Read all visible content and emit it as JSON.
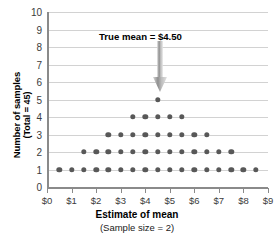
{
  "chart_data": {
    "type": "scatter",
    "title": "",
    "xlabel": "Estimate of mean",
    "xlabel_sub": "(Sample size = 2)",
    "ylabel": "Number of samples",
    "ylabel_sub": "(Total = 45)",
    "xlim": [
      0,
      9
    ],
    "ylim": [
      0,
      10
    ],
    "grid": true,
    "legend": "none",
    "x_tick_labels": [
      "$0",
      "$1",
      "$2",
      "$3",
      "$4",
      "$5",
      "$6",
      "$7",
      "$8",
      "$9"
    ],
    "x_tick_values": [
      0,
      1,
      2,
      3,
      4,
      5,
      6,
      7,
      8,
      9
    ],
    "y_tick_labels": [
      "0",
      "1",
      "2",
      "3",
      "4",
      "5",
      "6",
      "7",
      "8",
      "9",
      "10"
    ],
    "y_tick_values": [
      0,
      1,
      2,
      3,
      4,
      5,
      6,
      7,
      8,
      9,
      10
    ],
    "marker_color": "#585858",
    "gridline_color": "#d2d2d2",
    "axis_color": "#8a8a8a",
    "points": [
      {
        "x": 0.5,
        "y": 1
      },
      {
        "x": 1.0,
        "y": 1
      },
      {
        "x": 1.5,
        "y": 1
      },
      {
        "x": 2.0,
        "y": 1
      },
      {
        "x": 2.5,
        "y": 1
      },
      {
        "x": 3.0,
        "y": 1
      },
      {
        "x": 3.5,
        "y": 1
      },
      {
        "x": 4.0,
        "y": 1
      },
      {
        "x": 4.5,
        "y": 1
      },
      {
        "x": 5.0,
        "y": 1
      },
      {
        "x": 5.5,
        "y": 1
      },
      {
        "x": 6.0,
        "y": 1
      },
      {
        "x": 6.5,
        "y": 1
      },
      {
        "x": 7.0,
        "y": 1
      },
      {
        "x": 7.5,
        "y": 1
      },
      {
        "x": 8.0,
        "y": 1
      },
      {
        "x": 8.5,
        "y": 1
      },
      {
        "x": 1.5,
        "y": 2
      },
      {
        "x": 2.0,
        "y": 2
      },
      {
        "x": 2.5,
        "y": 2
      },
      {
        "x": 3.0,
        "y": 2
      },
      {
        "x": 3.5,
        "y": 2
      },
      {
        "x": 4.0,
        "y": 2
      },
      {
        "x": 4.5,
        "y": 2
      },
      {
        "x": 5.0,
        "y": 2
      },
      {
        "x": 5.5,
        "y": 2
      },
      {
        "x": 6.0,
        "y": 2
      },
      {
        "x": 6.5,
        "y": 2
      },
      {
        "x": 7.0,
        "y": 2
      },
      {
        "x": 7.5,
        "y": 2
      },
      {
        "x": 2.5,
        "y": 3
      },
      {
        "x": 3.0,
        "y": 3
      },
      {
        "x": 3.5,
        "y": 3
      },
      {
        "x": 4.0,
        "y": 3
      },
      {
        "x": 4.5,
        "y": 3
      },
      {
        "x": 5.0,
        "y": 3
      },
      {
        "x": 5.5,
        "y": 3
      },
      {
        "x": 6.0,
        "y": 3
      },
      {
        "x": 6.5,
        "y": 3
      },
      {
        "x": 3.5,
        "y": 4
      },
      {
        "x": 4.0,
        "y": 4
      },
      {
        "x": 4.5,
        "y": 4
      },
      {
        "x": 5.0,
        "y": 4
      },
      {
        "x": 5.5,
        "y": 4
      },
      {
        "x": 4.5,
        "y": 5
      }
    ],
    "annotations": [
      {
        "text": "True mean  =  $4.50",
        "arrow_x": 4.5,
        "arrow_from_y": 9.0,
        "arrow_to_y": 5.6,
        "color": "#000000"
      }
    ]
  }
}
